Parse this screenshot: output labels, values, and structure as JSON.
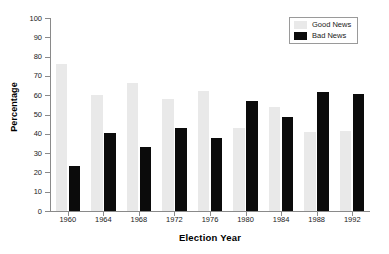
{
  "chart_data": {
    "type": "bar",
    "title": "",
    "xlabel": "Election Year",
    "ylabel": "Percentage",
    "categories": [
      "1960",
      "1964",
      "1968",
      "1972",
      "1976",
      "1980",
      "1984",
      "1988",
      "1992"
    ],
    "series": [
      {
        "name": "Good News",
        "color": "#e9e9e9",
        "values": [
          76,
          60,
          66.5,
          58,
          62,
          43,
          54,
          41,
          41.5
        ]
      },
      {
        "name": "Bad News",
        "color": "#0b0b0b",
        "values": [
          23.5,
          40.5,
          33,
          43,
          38,
          57,
          48.5,
          61.5,
          60.5
        ]
      }
    ],
    "ylim": [
      0,
      100
    ],
    "ytick_labels": [
      "100",
      "90",
      "80",
      "70",
      "60",
      "50",
      "40",
      "30",
      "20",
      "10",
      "0"
    ],
    "ytick_values": [
      100,
      90,
      80,
      70,
      60,
      50,
      40,
      30,
      20,
      10,
      0
    ],
    "grid": false,
    "legend_position": "top-right"
  },
  "legend": {
    "entries": [
      {
        "label": "Good News"
      },
      {
        "label": "Bad News"
      }
    ]
  },
  "axes": {
    "x_title": "Election Year",
    "y_title": "Percentage"
  }
}
